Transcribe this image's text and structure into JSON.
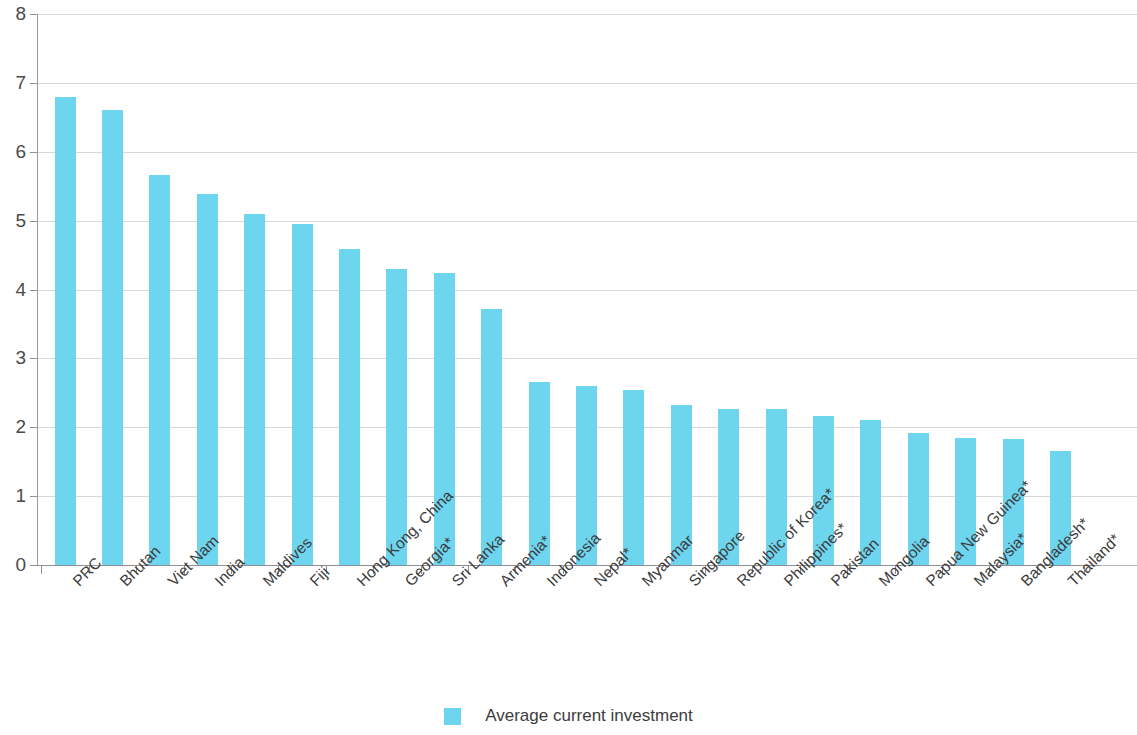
{
  "chart_data": {
    "type": "bar",
    "title": "",
    "subtitle": "",
    "xlabel": "",
    "ylabel": "",
    "ylim": [
      0,
      8
    ],
    "ytick_values": [
      0,
      1,
      2,
      3,
      4,
      5,
      6,
      7,
      8
    ],
    "ytick_labels": [
      "0",
      "1",
      "2",
      "3",
      "4",
      "5",
      "6",
      "7",
      "8"
    ],
    "grid": true,
    "legend_position": "bottom-center",
    "series_color": "#6ed5ef",
    "categories": [
      "PRC",
      "Bhutan",
      "Viet Nam",
      "India",
      "Maldives",
      "Fiji",
      "Hong Kong, China",
      "Georgia*",
      "Sri Lanka",
      "Armenia*",
      "Indonesia",
      "Nepal*",
      "Myanmar",
      "Singapore",
      "Republic of Korea*",
      "Philippines*",
      "Pakistan",
      "Mongolia",
      "Papua New Guinea*",
      "Malaysia*",
      "Bangladesh*",
      "Thailand*"
    ],
    "series": [
      {
        "name": "Average current investment",
        "color": "#6ed5ef",
        "values": [
          6.8,
          6.61,
          5.66,
          5.39,
          5.1,
          4.95,
          4.59,
          4.3,
          4.24,
          3.71,
          2.65,
          2.6,
          2.54,
          2.32,
          2.26,
          2.26,
          2.16,
          2.1,
          1.92,
          1.85,
          1.83,
          1.66
        ]
      }
    ]
  },
  "legend": {
    "items": [
      {
        "label": "Average current investment",
        "color": "#6ed5ef"
      }
    ]
  }
}
